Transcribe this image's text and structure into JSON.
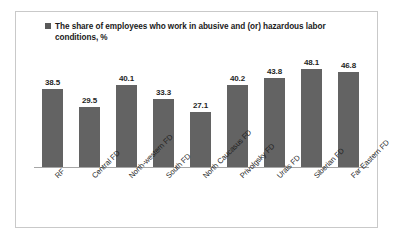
{
  "legend": {
    "marker_color": "#595959",
    "label": "The share of employees who work in abusive and (or) hazardous labor conditions, %"
  },
  "colors": {
    "bar": "#636363",
    "frame": "#c9c9c9",
    "axis": "#a6a6a6",
    "text": "#1f1f1f",
    "background": "#ffffff"
  },
  "chart_data": {
    "type": "bar",
    "title": "",
    "xlabel": "",
    "ylabel": "",
    "ylim": [
      0,
      55
    ],
    "grid": false,
    "legend_position": "top-left",
    "series_name": "The share of employees who work in abusive and (or) hazardous labor conditions, %",
    "categories": [
      "RF",
      "Central FD",
      "North-western FD",
      "South FD",
      "North Caucasus FD",
      "Privolgsky FD",
      "Urals FD",
      "Siberian FD",
      "Far Eastern FD"
    ],
    "values": [
      38.5,
      29.5,
      40.1,
      33.3,
      27.1,
      40.2,
      43.8,
      48.1,
      46.8
    ],
    "data_labels": [
      "38.5",
      "29.5",
      "40.1",
      "33.3",
      "27.1",
      "40.2",
      "43.8",
      "48.1",
      "46.8"
    ]
  }
}
